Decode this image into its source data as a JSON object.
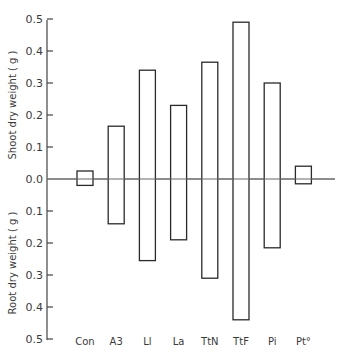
{
  "chart_data": {
    "type": "bar",
    "subtype": "diverging (shoot up, root down)",
    "title": "",
    "categories": [
      "Con",
      "A3",
      "Ll",
      "La",
      "TtN",
      "TtF",
      "Pi",
      "Pt°"
    ],
    "series": [
      {
        "name": "Shoot dry weight (g)",
        "direction": "up",
        "values": [
          0.025,
          0.165,
          0.34,
          0.23,
          0.365,
          0.49,
          0.3,
          0.04
        ]
      },
      {
        "name": "Root dry weight (g)",
        "direction": "down",
        "values": [
          0.02,
          0.14,
          0.255,
          0.19,
          0.31,
          0.44,
          0.215,
          0.015
        ]
      }
    ],
    "ylabel_top": "Shoot dry weight ( g )",
    "ylabel_bottom": "Root dry weight ( g )",
    "xlabel": "",
    "ylim_top": [
      0,
      0.5
    ],
    "ylim_bottom": [
      0,
      0.5
    ],
    "yticks_top": [
      "0.5",
      "0.4",
      "0.3",
      "0.2",
      "0.1"
    ],
    "zero_label": "0.0",
    "yticks_bottom": [
      "0.1",
      "0.2",
      "0.3",
      "0.4",
      "0.5"
    ],
    "grid": false,
    "legend": "none",
    "colors": {
      "bar_fill": "#ffffff",
      "bar_stroke": "#2a2a2a",
      "axis": "#444444"
    }
  }
}
